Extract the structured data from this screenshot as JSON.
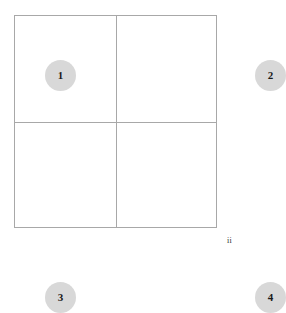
{
  "figure": {
    "name": "two-by-two-grid-diagram",
    "background_color": "#ffffff",
    "border_color": "#a8a8a8",
    "circle_fill_color": "#d8d8d8",
    "label_color": "#1a1a1a"
  },
  "grid": {
    "rows": 2,
    "columns": 2,
    "cells": [
      {
        "position": "top-left",
        "circle_label": "1",
        "annotation": ""
      },
      {
        "position": "top-right",
        "circle_label": "2",
        "annotation": ""
      },
      {
        "position": "bottom-left",
        "circle_label": "3",
        "annotation": ""
      },
      {
        "position": "bottom-right",
        "circle_label": "4",
        "annotation": "ii"
      }
    ]
  },
  "chart_data": {
    "type": "diagram",
    "title": "",
    "categories": [
      "1",
      "2",
      "3",
      "4"
    ],
    "values": [
      1,
      2,
      3,
      4
    ],
    "annotations": [
      "ii"
    ],
    "grid": true,
    "legend": "none"
  }
}
